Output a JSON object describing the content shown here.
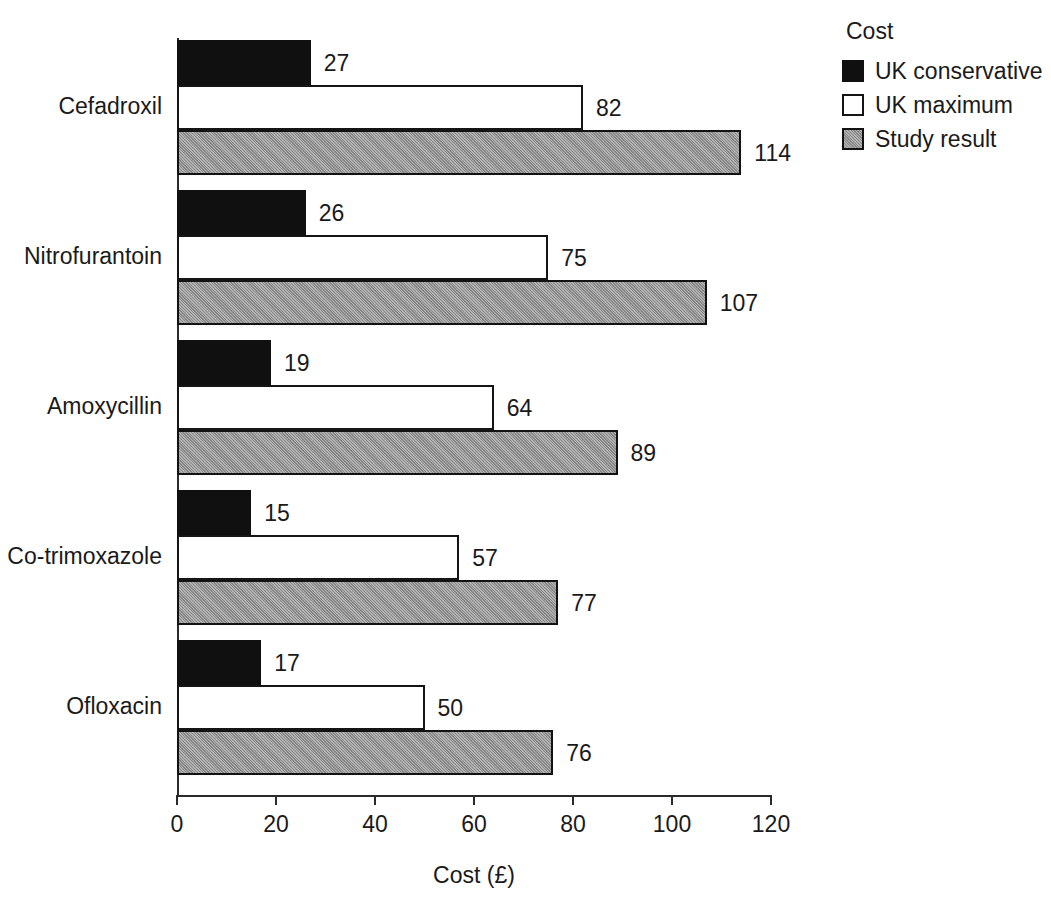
{
  "chart_data": {
    "type": "bar",
    "orientation": "horizontal",
    "title": "",
    "xlabel": "Cost (£)",
    "ylabel": "",
    "xlim": [
      0,
      120
    ],
    "xticks": [
      "0",
      "20",
      "40",
      "60",
      "80",
      "100",
      "120"
    ],
    "grid": false,
    "legend_title": "Cost",
    "legend_position": "top-right",
    "categories": [
      "Cefadroxil",
      "Nitrofurantoin",
      "Amoxycillin",
      "Co-trimoxazole",
      "Ofloxacin"
    ],
    "series": [
      {
        "name": "UK conservative",
        "color": "#101010",
        "values": [
          27,
          26,
          19,
          15,
          17
        ]
      },
      {
        "name": "UK maximum",
        "color": "#ffffff",
        "values": [
          82,
          75,
          64,
          57,
          50
        ]
      },
      {
        "name": "Study result",
        "color": "#9b9b9b",
        "values": [
          114,
          107,
          89,
          77,
          76
        ]
      }
    ],
    "data_labels": [
      [
        "27",
        "82",
        "114"
      ],
      [
        "26",
        "75",
        "107"
      ],
      [
        "19",
        "64",
        "89"
      ],
      [
        "15",
        "57",
        "77"
      ],
      [
        "17",
        "50",
        "76"
      ]
    ]
  },
  "legend": {
    "title": "Cost",
    "items": [
      {
        "label": "UK conservative",
        "swatch": "series-conservative"
      },
      {
        "label": "UK maximum",
        "swatch": "series-maximum"
      },
      {
        "label": "Study result",
        "swatch": "series-study"
      }
    ]
  },
  "axis": {
    "x_title": "Cost (£)",
    "ticks": [
      "0",
      "20",
      "40",
      "60",
      "80",
      "100",
      "120"
    ]
  },
  "footer": {
    "fragment": ""
  }
}
